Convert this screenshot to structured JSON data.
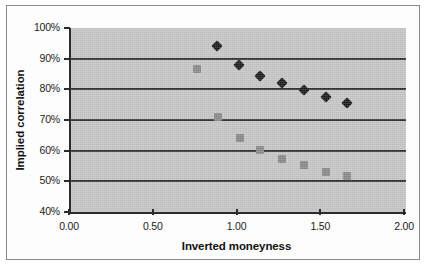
{
  "chart_data": {
    "type": "scatter",
    "title": "",
    "xlabel": "Inverted moneyness",
    "ylabel": "Implied correlation",
    "xlim": [
      0.0,
      2.0
    ],
    "ylim": [
      0.4,
      1.0
    ],
    "grid": "horizontal",
    "legend_position": "none",
    "x_tick_labels": [
      "0.00",
      "0.50",
      "1.00",
      "1.50",
      "2.00"
    ],
    "x_tick_values": [
      0.0,
      0.5,
      1.0,
      1.5,
      2.0
    ],
    "y_tick_labels": [
      "40%",
      "50%",
      "60%",
      "70%",
      "80%",
      "90%",
      "100%"
    ],
    "y_tick_values": [
      0.4,
      0.5,
      0.6,
      0.7,
      0.8,
      0.9,
      1.0
    ],
    "series": [
      {
        "name": "black-diamond-series",
        "marker": "diamond",
        "color": "#141414",
        "points": [
          {
            "x": 0.87,
            "y": 0.94
          },
          {
            "x": 1.0,
            "y": 0.88
          },
          {
            "x": 1.13,
            "y": 0.845
          },
          {
            "x": 1.26,
            "y": 0.82
          },
          {
            "x": 1.39,
            "y": 0.797
          },
          {
            "x": 1.52,
            "y": 0.775
          },
          {
            "x": 1.65,
            "y": 0.754
          }
        ]
      },
      {
        "name": "gray-square-series",
        "marker": "square",
        "color": "#848484",
        "points": [
          {
            "x": 0.75,
            "y": 0.865
          },
          {
            "x": 0.88,
            "y": 0.71
          },
          {
            "x": 1.01,
            "y": 0.642
          },
          {
            "x": 1.13,
            "y": 0.603
          },
          {
            "x": 1.26,
            "y": 0.574
          },
          {
            "x": 1.39,
            "y": 0.552
          },
          {
            "x": 1.52,
            "y": 0.532
          },
          {
            "x": 1.65,
            "y": 0.518
          }
        ]
      }
    ],
    "colors": {
      "plot_background": "#c2c2c2",
      "gridline": "#2b2b2b",
      "axis": "#2b2b2b",
      "figure_background": "#ffffff",
      "frame_border": "#8a8a8a"
    }
  }
}
